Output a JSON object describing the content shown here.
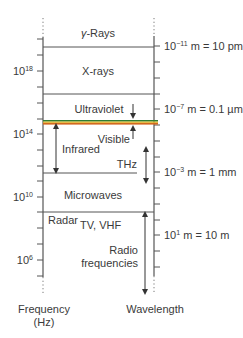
{
  "diagram": {
    "regions": [
      {
        "id": "gamma",
        "label_prefix": "γ",
        "label_suffix": "-Rays"
      },
      {
        "id": "xray",
        "label": "X-rays"
      },
      {
        "id": "uv",
        "label": "Ultraviolet"
      },
      {
        "id": "visible",
        "label": "Visible"
      },
      {
        "id": "infrared",
        "label": "Infrared"
      },
      {
        "id": "thz",
        "label": "THz"
      },
      {
        "id": "microwaves",
        "label": "Microwaves"
      },
      {
        "id": "radar",
        "label": "Radar"
      },
      {
        "id": "tv",
        "label": "TV, VHF"
      },
      {
        "id": "radio",
        "label_line1": "Radio",
        "label_line2": "frequencies"
      }
    ],
    "frequency_axis": {
      "label_line1": "Frequency",
      "label_line2": "(Hz)",
      "ticks": [
        {
          "base": "10",
          "exp": "18"
        },
        {
          "base": "10",
          "exp": "14"
        },
        {
          "base": "10",
          "exp": "10"
        },
        {
          "base": "10",
          "exp": "6"
        }
      ]
    },
    "wavelength_axis": {
      "label": "Wavelength",
      "ticks": [
        {
          "base": "10",
          "exp": "−11",
          "rest": " m = 10 pm"
        },
        {
          "base": "10",
          "exp": "−7",
          "rest": " m = 0.1 µm"
        },
        {
          "base": "10",
          "exp": "−3",
          "rest": " m = 1 mm"
        },
        {
          "base": "10",
          "exp": "1",
          "rest": " m = 10 m"
        }
      ]
    },
    "colors": {
      "line": "#555555",
      "text": "#3a3a3a",
      "visible_green": "#2e7d32",
      "visible_yellow": "#e6c229",
      "visible_orange": "#d2691e"
    }
  }
}
